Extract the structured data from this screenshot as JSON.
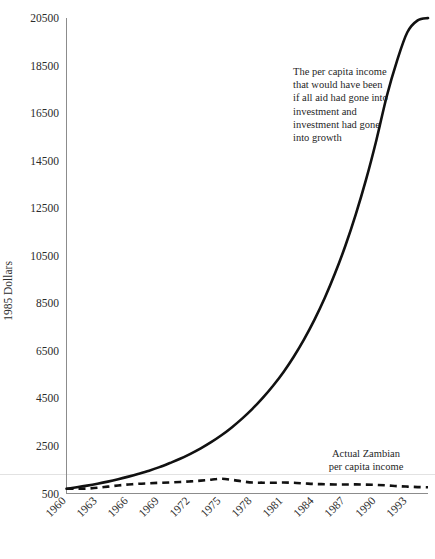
{
  "chart_data": {
    "type": "line",
    "title": "",
    "xlabel": "",
    "ylabel": "1985 Dollars",
    "ylim": [
      500,
      20500
    ],
    "ytick_step": 2000,
    "yticks": [
      500,
      2500,
      4500,
      6500,
      8500,
      10500,
      12500,
      14500,
      16500,
      18500,
      20500
    ],
    "xticks": [
      1960,
      1963,
      1966,
      1969,
      1972,
      1975,
      1978,
      1981,
      1984,
      1987,
      1990,
      1993
    ],
    "xlim": [
      1960,
      1995
    ],
    "grid": false,
    "legend": "none",
    "x": [
      1960,
      1961,
      1962,
      1963,
      1964,
      1965,
      1966,
      1967,
      1968,
      1969,
      1970,
      1971,
      1972,
      1973,
      1974,
      1975,
      1976,
      1977,
      1978,
      1979,
      1980,
      1981,
      1982,
      1983,
      1984,
      1985,
      1986,
      1987,
      1988,
      1989,
      1990,
      1991,
      1992,
      1993,
      1994,
      1995
    ],
    "series": [
      {
        "name": "The per capita income that would have been if all aid had gone into investment and investment had gone into growth",
        "style": "solid",
        "values": [
          700,
          760,
          830,
          910,
          1000,
          1100,
          1210,
          1330,
          1460,
          1610,
          1780,
          1960,
          2170,
          2400,
          2660,
          2950,
          3280,
          3650,
          4060,
          4520,
          5030,
          5600,
          6250,
          6980,
          7800,
          8720,
          9760,
          10920,
          12230,
          13700,
          15360,
          17200,
          18700,
          19900,
          20400,
          20500
        ]
      },
      {
        "name": "Actual Zambian per capita income",
        "style": "dashed",
        "values": [
          700,
          700,
          710,
          740,
          790,
          840,
          880,
          910,
          930,
          950,
          965,
          985,
          1010,
          1040,
          1080,
          1120,
          1075,
          1010,
          960,
          955,
          950,
          960,
          950,
          925,
          900,
          890,
          880,
          880,
          885,
          875,
          860,
          840,
          810,
          790,
          770,
          760
        ]
      }
    ],
    "annotations": [
      {
        "name": "counterfactual-annotation",
        "lines": [
          "The per capita income",
          "that would have been",
          "if all aid had gone into",
          "investment and",
          "investment had gone",
          "into growth"
        ],
        "align": "left",
        "x": 293,
        "y": 75
      },
      {
        "name": "actual-annotation",
        "lines": [
          "Actual Zambian",
          "per capita income"
        ],
        "align": "middle",
        "x": 366,
        "y": 457
      }
    ]
  },
  "colors": {
    "line": "#111111",
    "axis": "#8c8c8c",
    "rule": "#e2e2e2",
    "text": "#1f1f1f",
    "background": "#ffffff"
  }
}
